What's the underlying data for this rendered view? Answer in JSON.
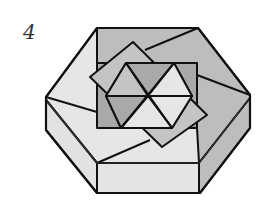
{
  "step_label": "4",
  "diagram": {
    "colors": {
      "outline": "#111111",
      "light_face": "#e6e6e6",
      "mid_face": "#c4c4c4",
      "dark_face": "#a9a9a9",
      "side_light": "#e2e2e2",
      "side_dark": "#bdbdbd"
    }
  }
}
